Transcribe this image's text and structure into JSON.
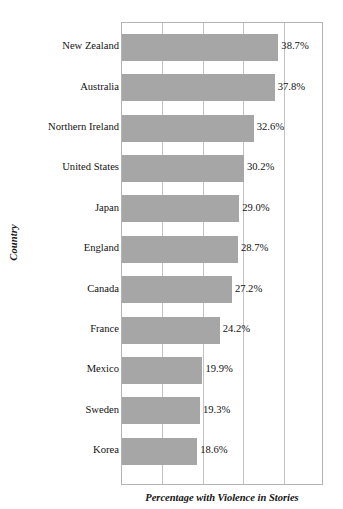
{
  "chart_data": {
    "type": "bar",
    "orientation": "horizontal",
    "title": "",
    "xlabel": "Percentage with Violence in Stories",
    "ylabel": "Country",
    "categories": [
      "New Zealand",
      "Australia",
      "Northern Ireland",
      "United States",
      "Japan",
      "England",
      "Canada",
      "France",
      "Mexico",
      "Sweden",
      "Korea"
    ],
    "values": [
      38.7,
      37.8,
      32.6,
      30.2,
      29.0,
      28.7,
      27.2,
      24.2,
      19.9,
      19.3,
      18.6
    ],
    "value_labels": [
      "38.7%",
      "37.8%",
      "32.6%",
      "30.2%",
      "29.0%",
      "28.7%",
      "27.2%",
      "24.2%",
      "19.9%",
      "19.3%",
      "18.6%"
    ],
    "xlim": [
      0,
      50
    ],
    "gridline_values": [
      0,
      10,
      20,
      30,
      40,
      50
    ],
    "grid": true,
    "legend": false,
    "bar_color": "#a6a6a6",
    "plot_border_color": "#b4b4b4",
    "background_color": "#ffffff"
  }
}
